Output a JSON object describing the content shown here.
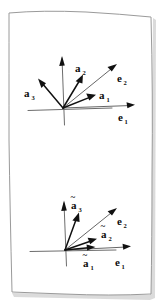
{
  "figure": {
    "medium": "pencil sketch on white paper",
    "paper": {
      "edge_color": "#9a9a9a",
      "fill_color": "#ffffff",
      "shadow_color": "#cfcfcf"
    },
    "ink_color": "#111111",
    "axis_color": "#5b5b5b"
  },
  "panels": [
    {
      "id": "upper",
      "name": "covariant-basis-panel",
      "origin": {
        "x": 63,
        "y": 108
      },
      "axes": [
        {
          "name": "horizontal-axis",
          "x1": 28,
          "y1": 110,
          "x2": 112,
          "y2": 108
        },
        {
          "name": "vertical-axis",
          "x1": 64,
          "y1": 125,
          "x2": 62,
          "y2": 58
        }
      ],
      "vectors": [
        {
          "id": "a1",
          "label": "a",
          "subscript": "1",
          "tilde": false,
          "tip": {
            "x": 95,
            "y": 95
          },
          "label_pos": {
            "x": 99,
            "y": 99
          },
          "kind": "vector"
        },
        {
          "id": "a2",
          "label": "a",
          "subscript": "2",
          "tilde": false,
          "tip": {
            "x": 83,
            "y": 75
          },
          "label_pos": {
            "x": 76,
            "y": 70
          },
          "kind": "vector"
        },
        {
          "id": "a3",
          "label": "a",
          "subscript": "3",
          "tilde": false,
          "tip": {
            "x": 38,
            "y": 79
          },
          "label_pos": {
            "x": 26,
            "y": 94
          },
          "kind": "vector"
        }
      ],
      "basis": [
        {
          "id": "e1",
          "label": "e",
          "subscript": "1",
          "tilde": false,
          "tip": {
            "x": 134,
            "y": 105
          },
          "label_pos": {
            "x": 119,
            "y": 118
          },
          "kind": "basis"
        },
        {
          "id": "e2",
          "label": "e",
          "subscript": "2",
          "tilde": false,
          "tip": {
            "x": 116,
            "y": 65
          },
          "label_pos": {
            "x": 118,
            "y": 79
          },
          "kind": "basis"
        }
      ]
    },
    {
      "id": "lower",
      "name": "contravariant-basis-panel",
      "origin": {
        "x": 65,
        "y": 250
      },
      "axes": [
        {
          "name": "horizontal-axis",
          "x1": 30,
          "y1": 251,
          "x2": 116,
          "y2": 250
        },
        {
          "name": "vertical-axis",
          "x1": 66,
          "y1": 266,
          "x2": 64,
          "y2": 203
        }
      ],
      "vectors": [
        {
          "id": "a1t",
          "label": "a",
          "subscript": "1",
          "tilde": true,
          "tip": {
            "x": 95,
            "y": 247
          },
          "label_pos": {
            "x": 86,
            "y": 264
          },
          "kind": "vector"
        },
        {
          "id": "a2t",
          "label": "a",
          "subscript": "2",
          "tilde": true,
          "tip": {
            "x": 97,
            "y": 238
          },
          "label_pos": {
            "x": 102,
            "y": 235
          },
          "kind": "vector"
        },
        {
          "id": "a3t",
          "label": "a",
          "subscript": "3",
          "tilde": true,
          "tip": {
            "x": 79,
            "y": 212
          },
          "label_pos": {
            "x": 72,
            "y": 205
          },
          "kind": "vector"
        }
      ],
      "basis": [
        {
          "id": "e1b",
          "label": "e",
          "subscript": "1",
          "tilde": false,
          "tip": {
            "x": 130,
            "y": 246
          },
          "label_pos": {
            "x": 116,
            "y": 263
          },
          "kind": "basis"
        },
        {
          "id": "e2b",
          "label": "e",
          "subscript": "2",
          "tilde": false,
          "tip": {
            "x": 116,
            "y": 209
          },
          "label_pos": {
            "x": 117,
            "y": 222
          },
          "kind": "basis"
        }
      ]
    }
  ]
}
